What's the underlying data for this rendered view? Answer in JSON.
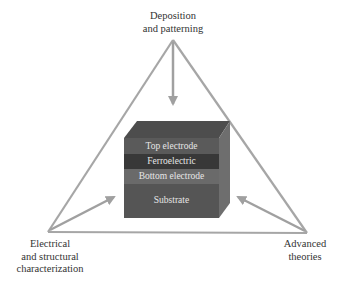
{
  "diagram": {
    "vertices": {
      "top": {
        "line1": "Deposition",
        "line2": "and patterning"
      },
      "left": {
        "line1": "Electrical",
        "line2": "and structural",
        "line3": "characterization"
      },
      "right": {
        "line1": "Advanced",
        "line2": "theories"
      }
    },
    "stack_layers": [
      {
        "label": "Top electrode",
        "color": "#5a5a5a"
      },
      {
        "label": "Ferroelectric",
        "color": "#3a3a3a"
      },
      {
        "label": "Bottom electrode",
        "color": "#6a6a6a"
      },
      {
        "label": "Substrate",
        "color": "#555555"
      }
    ],
    "colors": {
      "triangle_line": "#a6a6a6",
      "arrow": "#a0a0a0",
      "text": "#333333",
      "cube_top": "#4d4d4d",
      "cube_side": "#6e6e6e"
    }
  }
}
